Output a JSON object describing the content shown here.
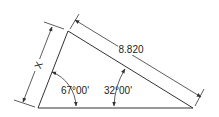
{
  "diagram": {
    "type": "trigonometry-triangle",
    "labels": {
      "hypotenuse_length": "8.820",
      "side_x": "X",
      "angle_left": "67°00'",
      "angle_right": "32°00'"
    },
    "colors": {
      "line": "#333333",
      "background": "#ffffff"
    }
  }
}
